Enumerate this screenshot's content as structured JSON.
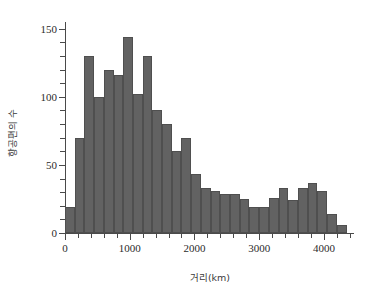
{
  "chart_data": {
    "type": "bar",
    "title": "",
    "subtitle": "",
    "xlabel": "거리(km)",
    "ylabel": "항공편의 수",
    "xlim": [
      0,
      4450
    ],
    "ylim": [
      0,
      155
    ],
    "grid": false,
    "legend": null,
    "bin_width": 150,
    "xticks": [
      0,
      1000,
      2000,
      3000,
      4000
    ],
    "xtick_labels": [
      "0",
      "1000",
      "2000",
      "3000",
      "4000"
    ],
    "xminor_ticks": [
      200,
      400,
      600,
      800,
      1200,
      1400,
      1600,
      1800,
      2200,
      2400,
      2600,
      2800,
      3200,
      3400,
      3600,
      3800,
      4200,
      4400
    ],
    "yticks": [
      0,
      50,
      100,
      150
    ],
    "ytick_labels": [
      "0",
      "50",
      "100",
      "150"
    ],
    "yminor_ticks": [
      10,
      20,
      30,
      40,
      60,
      70,
      80,
      90,
      110,
      120,
      130,
      140
    ],
    "bar_color": "#626262",
    "bar_edge_color": "#4f4f4f",
    "axis_color": "#4a4a4a",
    "background_color": "#ffffff",
    "categories": [
      "0-150",
      "150-300",
      "300-450",
      "450-600",
      "600-750",
      "750-900",
      "900-1050",
      "1050-1200",
      "1200-1350",
      "1350-1500",
      "1500-1650",
      "1650-1800",
      "1800-1950",
      "1950-2100",
      "2100-2250",
      "2250-2400",
      "2400-2550",
      "2550-2700",
      "2700-2850",
      "2850-3000",
      "3000-3150",
      "3150-3300",
      "3300-3450",
      "3450-3600",
      "3600-3750",
      "3750-3900",
      "3900-4050",
      "4050-4200",
      "4200-4350"
    ],
    "bin_starts": [
      0,
      150,
      300,
      450,
      600,
      750,
      900,
      1050,
      1200,
      1350,
      1500,
      1650,
      1800,
      1950,
      2100,
      2250,
      2400,
      2550,
      2700,
      2850,
      3000,
      3150,
      3300,
      3450,
      3600,
      3750,
      3900,
      4050,
      4200
    ],
    "values": [
      19,
      70,
      130,
      100,
      120,
      116,
      144,
      102,
      130,
      90,
      80,
      60,
      70,
      43,
      33,
      31,
      29,
      29,
      25,
      19,
      19,
      26,
      33,
      24,
      33,
      37,
      31,
      14,
      6
    ]
  }
}
